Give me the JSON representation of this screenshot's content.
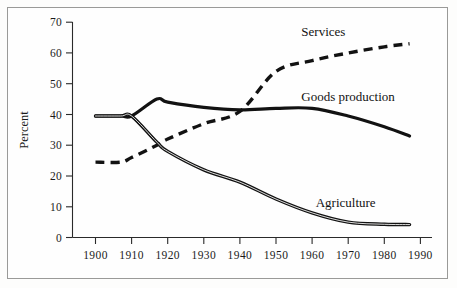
{
  "chart_data": {
    "type": "line",
    "title": "",
    "xlabel": "",
    "ylabel": "Percent",
    "xlim": [
      1900,
      1990
    ],
    "ylim": [
      0,
      70
    ],
    "grid": false,
    "legend_position": "inline-annotations",
    "xticks": [
      "1900",
      "1910",
      "1920",
      "1930",
      "1940",
      "1950",
      "1960",
      "1970",
      "1980",
      "1990"
    ],
    "yticks": [
      "0",
      "10",
      "20",
      "30",
      "40",
      "50",
      "60",
      "70"
    ],
    "x": [
      1900,
      1907,
      1910,
      1917,
      1920,
      1930,
      1940,
      1950,
      1960,
      1970,
      1980,
      1987
    ],
    "series": [
      {
        "name": "Services",
        "style": "dashed",
        "values": [
          24.5,
          24.5,
          26.0,
          30.0,
          32.0,
          37.0,
          41.0,
          54.0,
          57.5,
          60.0,
          62.0,
          63.0
        ]
      },
      {
        "name": "Goods production",
        "style": "solid",
        "values": [
          39.5,
          39.5,
          39.5,
          45.0,
          44.0,
          42.3,
          41.5,
          42.0,
          42.0,
          39.5,
          36.0,
          33.0
        ]
      },
      {
        "name": "Agriculture",
        "style": "solid-white-core",
        "values": [
          39.5,
          39.5,
          39.5,
          31.0,
          28.0,
          22.0,
          18.0,
          12.5,
          8.0,
          5.0,
          4.3,
          4.2
        ]
      }
    ],
    "annotations": [
      {
        "text": "Services",
        "x": 1957,
        "y": 65.5
      },
      {
        "text": "Goods production",
        "x": 1957,
        "y": 44.5
      },
      {
        "text": "Agriculture",
        "x": 1961,
        "y": 10.0
      }
    ],
    "colors": {
      "line": "#121212",
      "axis": "#2a2a2a",
      "frame": "#9a9a98",
      "background": "#fefefe",
      "agriculture_core": "#f2f2f0"
    }
  }
}
